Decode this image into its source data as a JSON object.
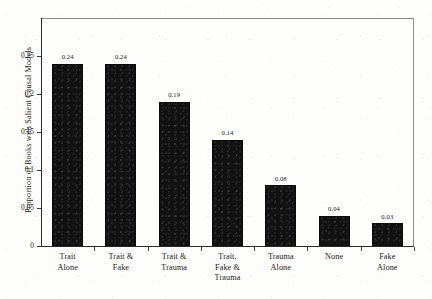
{
  "chart_data": {
    "type": "bar",
    "title": "",
    "xlabel": "",
    "ylabel": "Proportion of Books with Salient Causal Models",
    "categories": [
      "Trait Alone",
      "Trait & Fake",
      "Trait & Trauma",
      "Trait, Fake & Trauma",
      "Trauma Alone",
      "None",
      "Fake Alone"
    ],
    "category_lines": [
      [
        "Trait",
        "Alone"
      ],
      [
        "Trait &",
        "Fake"
      ],
      [
        "Trait &",
        "Trauma"
      ],
      [
        "Trait,",
        "Fake &",
        "Trauma"
      ],
      [
        "Trauma",
        "Alone"
      ],
      [
        "None"
      ],
      [
        "Fake",
        "Alone"
      ]
    ],
    "values": [
      0.24,
      0.24,
      0.19,
      0.14,
      0.08,
      0.04,
      0.03
    ],
    "value_labels": [
      "0.24",
      "0.24",
      "0.19",
      "0.14",
      "0.08",
      "0.04",
      "0.03"
    ],
    "ylim": [
      0,
      0.3
    ],
    "yticks": [
      0,
      0.05,
      0.1,
      0.15,
      0.2,
      0.25
    ],
    "ytick_labels": [
      "0",
      "0.05",
      "0.1",
      "0.15",
      "0.2",
      "0.25"
    ],
    "grid": false,
    "legend": null,
    "bar_color": "#121212",
    "axis_color": "#2a2a2a",
    "background_color": "#fdfdfb"
  }
}
